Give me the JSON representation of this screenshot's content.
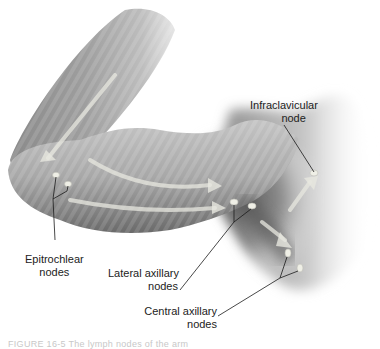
{
  "figure": {
    "labels": {
      "infraclavicular": {
        "line1": "Infraclavicular",
        "line2": "node"
      },
      "epitrochlear": {
        "line1": "Epitrochlear",
        "line2": "nodes"
      },
      "lateral_axillary": {
        "line1": "Lateral axillary",
        "line2": "nodes"
      },
      "central_axillary": {
        "line1": "Central axillary",
        "line2": "nodes"
      }
    },
    "caption": "FIGURE 16-5  The lymph nodes of the arm",
    "colors": {
      "skin_dark": "#6e6e6e",
      "skin_mid": "#9a9a9a",
      "skin_light": "#d4d4d4",
      "node_fill": "#efefe6",
      "leader_line": "#1a1a1a",
      "label_text": "#222222"
    }
  }
}
